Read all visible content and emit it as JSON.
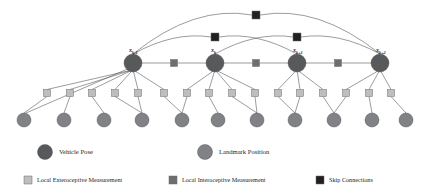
{
  "diagram": {
    "colors": {
      "vehicle_pose": "#58595b",
      "landmark": "#808285",
      "exteroceptive": "#bcbec0",
      "interoceptive": "#6d6e71",
      "skip": "#231f20",
      "edge": "#58595b",
      "background": "#ffffff",
      "text": "#231f20"
    },
    "poses": [
      {
        "id": "pose-k-minus-1",
        "label_base": "x",
        "label_sub": "k-1",
        "x": 133,
        "y": 63,
        "r": 9
      },
      {
        "id": "pose-k",
        "label_base": "x",
        "label_sub": "k",
        "x": 215,
        "y": 63,
        "r": 9
      },
      {
        "id": "pose-k-plus-1",
        "label_base": "x",
        "label_sub": "k+1",
        "x": 297,
        "y": 63,
        "r": 9
      },
      {
        "id": "pose-k-plus-2",
        "label_base": "x",
        "label_sub": "k+2",
        "x": 380,
        "y": 63,
        "r": 9
      }
    ],
    "interoceptive_squares": [
      {
        "x": 174,
        "y": 63,
        "size": 7
      },
      {
        "x": 256,
        "y": 63,
        "size": 7
      },
      {
        "x": 338,
        "y": 63,
        "size": 7
      }
    ],
    "skip_squares": [
      {
        "x": 256,
        "y": 15,
        "size": 8
      },
      {
        "x": 215,
        "y": 37,
        "size": 8
      },
      {
        "x": 297,
        "y": 37,
        "size": 8
      }
    ],
    "skip_arcs": [
      {
        "from": "pose-k-minus-1",
        "to": "pose-k-plus-2",
        "via_square": 0,
        "peak_y": 15
      },
      {
        "from": "pose-k-minus-1",
        "to": "pose-k-plus-1",
        "via_square": 1,
        "peak_y": 37
      },
      {
        "from": "pose-k",
        "to": "pose-k-plus-2",
        "via_square": 2,
        "peak_y": 37
      }
    ],
    "exteroceptive_squares": [
      {
        "x": 47,
        "y": 93,
        "size": 7
      },
      {
        "x": 70,
        "y": 93,
        "size": 7
      },
      {
        "x": 92,
        "y": 93,
        "size": 7
      },
      {
        "x": 115,
        "y": 93,
        "size": 7
      },
      {
        "x": 138,
        "y": 93,
        "size": 7
      },
      {
        "x": 164,
        "y": 93,
        "size": 7
      },
      {
        "x": 187,
        "y": 93,
        "size": 7
      },
      {
        "x": 209,
        "y": 93,
        "size": 7
      },
      {
        "x": 232,
        "y": 93,
        "size": 7
      },
      {
        "x": 255,
        "y": 93,
        "size": 7
      },
      {
        "x": 278,
        "y": 93,
        "size": 7
      },
      {
        "x": 300,
        "y": 93,
        "size": 7
      },
      {
        "x": 323,
        "y": 93,
        "size": 7
      },
      {
        "x": 346,
        "y": 93,
        "size": 7
      },
      {
        "x": 369,
        "y": 93,
        "size": 7
      },
      {
        "x": 391,
        "y": 93,
        "size": 7
      }
    ],
    "landmarks": [
      {
        "x": 24,
        "y": 120,
        "r": 7
      },
      {
        "x": 64,
        "y": 120,
        "r": 7
      },
      {
        "x": 104,
        "y": 120,
        "r": 7
      },
      {
        "x": 142,
        "y": 120,
        "r": 7
      },
      {
        "x": 182,
        "y": 120,
        "r": 7
      },
      {
        "x": 218,
        "y": 120,
        "r": 7
      },
      {
        "x": 257,
        "y": 120,
        "r": 7
      },
      {
        "x": 295,
        "y": 120,
        "r": 7
      },
      {
        "x": 334,
        "y": 120,
        "r": 7
      },
      {
        "x": 372,
        "y": 120,
        "r": 7
      },
      {
        "x": 406,
        "y": 120,
        "r": 7
      }
    ]
  },
  "legend": {
    "row1": [
      {
        "key": "vehicle-pose",
        "shape": "circle",
        "color": "#58595b",
        "label": "Vehicle Pose"
      },
      {
        "key": "landmark-position",
        "shape": "circle",
        "color": "#808285",
        "label": "Landmark Position"
      }
    ],
    "row2": [
      {
        "key": "local-exteroceptive",
        "shape": "square",
        "color": "#bcbec0",
        "label": "Local Exteroceptive Measurement"
      },
      {
        "key": "local-interoceptive",
        "shape": "square",
        "color": "#6d6e71",
        "label": "Local Interoceptive Measurement"
      },
      {
        "key": "skip-connections",
        "shape": "square",
        "color": "#231f20",
        "label": "Skip Connections"
      }
    ]
  }
}
